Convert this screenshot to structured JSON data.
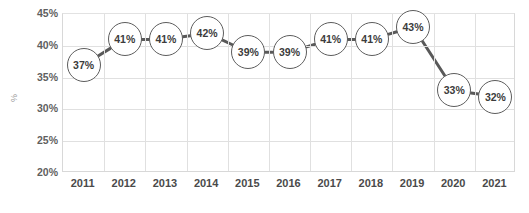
{
  "chart_data": {
    "type": "line",
    "title": "",
    "subtitle": "",
    "xlabel": "",
    "ylabel": "%",
    "categories": [
      "2011",
      "2012",
      "2013",
      "2014",
      "2015",
      "2016",
      "2017",
      "2018",
      "2019",
      "2020",
      "2021"
    ],
    "values": [
      37,
      41,
      41,
      42,
      39,
      39,
      41,
      41,
      43,
      33,
      32
    ],
    "point_labels": [
      "37%",
      "41%",
      "41%",
      "42%",
      "39%",
      "39%",
      "41%",
      "41%",
      "43%",
      "33%",
      "32%"
    ],
    "ylim": [
      20,
      45
    ],
    "y_ticks": [
      20,
      25,
      30,
      35,
      40,
      45
    ],
    "y_tick_labels": [
      "20%",
      "25%",
      "30%",
      "35%",
      "40%",
      "45%"
    ],
    "grid": true,
    "legend": "none",
    "series": [
      {
        "name": "",
        "values": [
          37,
          41,
          41,
          42,
          39,
          39,
          41,
          41,
          43,
          33,
          32
        ]
      }
    ],
    "colors": {
      "line": "#595959",
      "marker_fill": "#ffffff",
      "marker_stroke": "#5d5d5d",
      "label_text": "#3c3c3c",
      "grid": "#e0e0e0",
      "axis_text": "#4a4a4a",
      "plot_background": "#ffffff"
    }
  }
}
